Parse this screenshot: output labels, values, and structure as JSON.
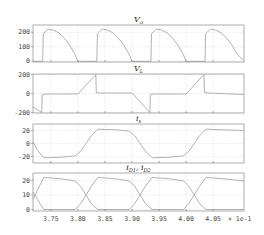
{
  "figure": {
    "x_multiplier_label": "× 1e-1",
    "colors": {
      "trace": "#a8a8a8",
      "frame": "#9a9a9a",
      "grid": "#d2d2d2",
      "text": "#444444"
    }
  },
  "chart_data": [
    {
      "type": "line",
      "title": "V_o",
      "title_main": "V",
      "title_sub": "o",
      "xlabel": "",
      "ylabel": "",
      "xlim": [
        3.717,
        4.107
      ],
      "ylim": [
        -5,
        250
      ],
      "yticks": [
        0,
        100,
        200
      ],
      "grid": true,
      "series": [
        {
          "name": "V_o",
          "x": [
            3.717,
            3.735,
            3.736,
            3.745,
            3.755,
            3.765,
            3.775,
            3.785,
            3.795,
            3.8,
            3.835,
            3.836,
            3.845,
            3.855,
            3.865,
            3.875,
            3.885,
            3.895,
            3.9,
            3.935,
            3.936,
            3.945,
            3.955,
            3.965,
            3.975,
            3.985,
            3.995,
            4.0,
            4.035,
            4.036,
            4.045,
            4.055,
            4.065,
            4.075,
            4.085,
            4.095,
            4.107
          ],
          "y": [
            0,
            0,
            190,
            222,
            215,
            195,
            160,
            110,
            45,
            0,
            0,
            190,
            222,
            215,
            195,
            160,
            110,
            45,
            0,
            0,
            190,
            222,
            215,
            195,
            160,
            110,
            45,
            0,
            0,
            190,
            222,
            215,
            195,
            160,
            110,
            45,
            5
          ]
        }
      ]
    },
    {
      "type": "line",
      "title": "V_L",
      "title_main": "V",
      "title_sub": "L",
      "xlabel": "",
      "ylabel": "",
      "xlim": [
        3.717,
        4.107
      ],
      "ylim": [
        -205,
        205
      ],
      "yticks": [
        -200,
        0,
        200
      ],
      "grid": true,
      "series": [
        {
          "name": "V_L",
          "x": [
            3.717,
            3.733,
            3.734,
            3.74,
            3.8,
            3.833,
            3.834,
            3.84,
            3.9,
            3.933,
            3.934,
            3.94,
            4.0,
            4.033,
            4.034,
            4.04,
            4.107
          ],
          "y": [
            -140,
            -200,
            -15,
            -5,
            -5,
            200,
            10,
            5,
            5,
            -200,
            -15,
            -5,
            -5,
            200,
            10,
            5,
            -10
          ]
        }
      ]
    },
    {
      "type": "line",
      "title": "i_s",
      "title_main": "i",
      "title_sub": "s",
      "xlabel": "",
      "ylabel": "",
      "xlim": [
        3.717,
        4.107
      ],
      "ylim": [
        -30,
        30
      ],
      "yticks": [
        -20,
        0,
        20
      ],
      "grid": true,
      "series": [
        {
          "name": "i_s",
          "x": [
            3.717,
            3.725,
            3.737,
            3.77,
            3.795,
            3.805,
            3.815,
            3.825,
            3.837,
            3.87,
            3.895,
            3.905,
            3.915,
            3.925,
            3.937,
            3.97,
            3.995,
            4.005,
            4.015,
            4.025,
            4.037,
            4.107
          ],
          "y": [
            3,
            -10,
            -22,
            -21,
            -19,
            -12,
            0,
            12,
            22,
            21,
            19,
            12,
            0,
            -12,
            -22,
            -21,
            -19,
            -12,
            0,
            12,
            22,
            20
          ]
        }
      ]
    },
    {
      "type": "line",
      "title": "i_D1, i_D2",
      "title_main": "i",
      "title_sub": "D1",
      "title_main2": "i",
      "title_sub2": "D2",
      "xlabel": "",
      "ylabel": "",
      "xlim": [
        3.717,
        4.107
      ],
      "ylim": [
        -1,
        25
      ],
      "yticks": [
        0,
        10,
        20
      ],
      "xticks": [
        3.75,
        3.8,
        3.85,
        3.9,
        3.95,
        4.0,
        4.05
      ],
      "xticklabels": [
        "3.75",
        "3.80",
        "3.85",
        "3.90",
        "3.95",
        "4.00",
        "4.05"
      ],
      "grid": true,
      "series": [
        {
          "name": "i_D1",
          "x": [
            3.717,
            3.725,
            3.737,
            3.77,
            3.795,
            3.805,
            3.815,
            3.825,
            3.837,
            3.895,
            3.905,
            3.915,
            3.925,
            3.937,
            3.97,
            3.995,
            4.005,
            4.015,
            4.025,
            4.037,
            4.107
          ],
          "y": [
            7,
            13,
            22,
            21,
            19.5,
            16,
            10,
            4,
            0,
            0,
            4,
            10,
            16,
            22,
            21,
            19.5,
            16,
            10,
            4,
            0,
            0
          ]
        },
        {
          "name": "i_D2",
          "x": [
            3.717,
            3.725,
            3.737,
            3.795,
            3.805,
            3.815,
            3.825,
            3.837,
            3.87,
            3.895,
            3.905,
            3.915,
            3.925,
            3.937,
            3.995,
            4.005,
            4.015,
            4.025,
            4.037,
            4.07,
            4.107
          ],
          "y": [
            12,
            7,
            0,
            0,
            4,
            10,
            16,
            22,
            21,
            19.5,
            16,
            10,
            4,
            0,
            0,
            4,
            10,
            16,
            22,
            21,
            19.5
          ]
        }
      ]
    }
  ]
}
